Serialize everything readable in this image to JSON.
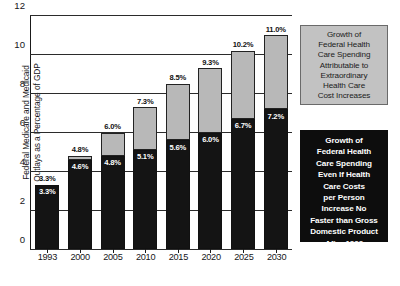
{
  "chart_data": {
    "type": "bar",
    "subtype": "stacked-bar",
    "title": "",
    "xlabel": "",
    "ylabel": "Federal Medicare and Medicaid\nOutlays as a Percentage of GDP",
    "categories": [
      "1993",
      "2000",
      "2005",
      "2010",
      "2015",
      "2020",
      "2025",
      "2030"
    ],
    "ylim": [
      0,
      12
    ],
    "yticks": [
      "0",
      "2",
      "4",
      "6",
      "8",
      "10",
      "12"
    ],
    "grid": true,
    "legend_position": "right",
    "series": [
      {
        "name": "Growth of Federal Health Care Spending Even If Health Care Costs per Person Increase No Faster than Gross Domestic Product After 1999",
        "color": "#141414",
        "values": [
          3.3,
          4.6,
          4.8,
          5.1,
          5.6,
          6.0,
          6.7,
          7.2
        ],
        "labels": [
          "3.3%",
          "4.6%",
          "4.8%",
          "5.1%",
          "5.6%",
          "6.0%",
          "6.7%",
          "7.2%"
        ]
      },
      {
        "name": "Growth of Federal Health Care Spending Attributable to Extraordinary Health Care Cost Increases",
        "color": "#b8b8b8",
        "values": [
          0.0,
          0.2,
          1.2,
          2.2,
          2.9,
          3.3,
          3.5,
          3.8
        ]
      }
    ],
    "totals": [
      3.3,
      4.8,
      6.0,
      7.3,
      8.5,
      9.3,
      10.2,
      11.0
    ],
    "total_labels": [
      "3.3%",
      "4.8%",
      "6.0%",
      "7.3%",
      "8.5%",
      "9.3%",
      "10.2%",
      "11.0%"
    ]
  },
  "legend": {
    "light": {
      "text": "Growth of\nFederal Health\nCare Spending\nAttributable to\nExtraordinary\nHealth Care\nCost Increases",
      "swatch_color": "#b8b8b8"
    },
    "dark": {
      "text": "Growth of\nFederal Health\nCare Spending\nEven If Health\nCare Costs\nper Person\nIncrease No\nFaster than Gross\nDomestic Product\nAfter 1999",
      "swatch_color": "#0d0d0d"
    }
  }
}
